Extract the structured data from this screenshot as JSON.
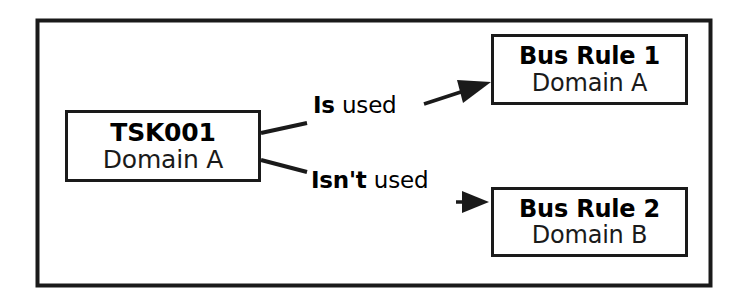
{
  "diagram": {
    "frame": {
      "border_color": "#1a1a1a",
      "background": "#ffffff"
    },
    "nodes": [
      {
        "id": "task",
        "title": "TSK001",
        "subtitle": "Domain A"
      },
      {
        "id": "rule-1",
        "title": "Bus Rule 1",
        "subtitle": "Domain A"
      },
      {
        "id": "rule-2",
        "title": "Bus Rule 2",
        "subtitle": "Domain B"
      }
    ],
    "edges": [
      {
        "id": "is-used",
        "label_bold": "Is",
        "label_plain": " used",
        "from": "task",
        "to": "rule-1",
        "arrow": "solid-triangle"
      },
      {
        "id": "isnt-used",
        "label_bold": "Isn't",
        "label_plain": " used",
        "from": "task",
        "to": "rule-2",
        "arrow": "solid-triangle"
      }
    ]
  }
}
